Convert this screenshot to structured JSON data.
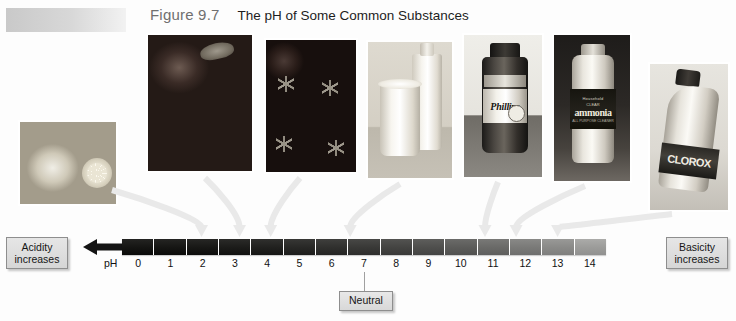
{
  "figure": {
    "number": "Figure 9.7",
    "title": "The pH of Some Common Substances"
  },
  "scale": {
    "ph_label": "pH",
    "ticks": [
      "0",
      "1",
      "2",
      "3",
      "4",
      "5",
      "6",
      "7",
      "8",
      "9",
      "10",
      "11",
      "12",
      "13",
      "14"
    ],
    "left_label": {
      "line1": "Acidity",
      "line2": "increases"
    },
    "right_label": {
      "line1": "Basicity",
      "line2": "increases"
    },
    "neutral_label": "Neutral",
    "neutral_ph": 7,
    "min": 0,
    "max": 14,
    "acid_color": "#15110f",
    "base_color": "#9b9b9b",
    "arrow_color": "#1a1a1a",
    "callout_arrow_color": "#e9e9e9"
  },
  "photos": [
    {
      "name": "lemons",
      "caption": "lemons",
      "ph": 2.3
    },
    {
      "name": "strawberries",
      "caption": "strawberries",
      "ph": 3.4
    },
    {
      "name": "tomatoes",
      "caption": "tomatoes",
      "ph": 4.3
    },
    {
      "name": "milk",
      "caption": "milk",
      "ph": 6.6
    },
    {
      "name": "phillips",
      "caption": "Phillips",
      "ph": 10.5
    },
    {
      "name": "ammonia",
      "caption": "ammonia",
      "ph": 11.4
    },
    {
      "name": "clorox",
      "caption": "CLOROX",
      "ph": 12.6
    }
  ],
  "product_labels": {
    "phillips_brand": "Phillips",
    "ammonia_brand": "Household",
    "ammonia_sub": "CLEAR",
    "ammonia_name": "ammonia",
    "ammonia_fine": "ALL PURPOSE CLEANER",
    "clorox_brand": "CLOROX"
  }
}
